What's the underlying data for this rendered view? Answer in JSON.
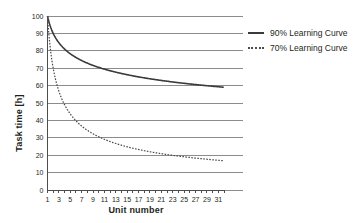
{
  "chart_data": {
    "type": "line",
    "title": "",
    "xlabel": "Unit number",
    "ylabel": "Task time [h]",
    "xlim": [
      1,
      32
    ],
    "ylim": [
      0,
      100
    ],
    "grid": true,
    "legend_position": "right",
    "y_ticks": [
      0,
      10,
      20,
      30,
      40,
      50,
      60,
      70,
      80,
      90,
      100
    ],
    "x_ticks": [
      1,
      3,
      5,
      7,
      9,
      11,
      13,
      15,
      17,
      19,
      21,
      23,
      25,
      27,
      29,
      31
    ],
    "x": [
      1,
      2,
      3,
      4,
      5,
      6,
      7,
      8,
      9,
      10,
      11,
      12,
      13,
      14,
      15,
      16,
      17,
      18,
      19,
      20,
      21,
      22,
      23,
      24,
      25,
      26,
      27,
      28,
      29,
      30,
      31,
      32
    ],
    "series": [
      {
        "name": "90% Learning Curve",
        "style": "solid",
        "color": "#3b3b3b",
        "values": [
          100.0,
          90.0,
          84.6,
          81.0,
          78.3,
          76.2,
          74.4,
          72.9,
          71.6,
          70.5,
          69.4,
          68.5,
          67.7,
          66.9,
          66.2,
          65.6,
          65.0,
          64.4,
          63.9,
          63.4,
          63.0,
          62.5,
          62.1,
          61.7,
          61.4,
          61.0,
          60.7,
          60.3,
          60.0,
          59.7,
          59.4,
          59.0
        ]
      },
      {
        "name": "70% Learning Curve",
        "style": "dotted",
        "color": "#4a4a4a",
        "values": [
          100.0,
          70.0,
          56.8,
          49.0,
          43.7,
          39.8,
          36.8,
          34.3,
          32.3,
          30.6,
          29.1,
          27.8,
          26.7,
          25.7,
          24.8,
          24.0,
          23.3,
          22.6,
          22.0,
          21.4,
          20.9,
          20.4,
          20.0,
          19.5,
          19.1,
          18.8,
          18.4,
          18.1,
          17.8,
          17.5,
          17.2,
          16.8
        ]
      }
    ]
  },
  "legend": {
    "items": [
      {
        "label": "90% Learning Curve",
        "style": "solid"
      },
      {
        "label": "70% Learning Curve",
        "style": "dotted"
      }
    ]
  }
}
